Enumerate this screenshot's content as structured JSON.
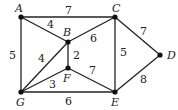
{
  "graph": {
    "nodes": [
      {
        "id": "A",
        "x": 21,
        "y": 17,
        "lx": 15,
        "ly": 12
      },
      {
        "id": "B",
        "x": 68,
        "y": 42,
        "lx": 63,
        "ly": 36
      },
      {
        "id": "C",
        "x": 115,
        "y": 17,
        "lx": 112,
        "ly": 12
      },
      {
        "id": "D",
        "x": 160,
        "y": 55,
        "lx": 167,
        "ly": 59
      },
      {
        "id": "E",
        "x": 115,
        "y": 92,
        "lx": 111,
        "ly": 106
      },
      {
        "id": "F",
        "x": 68,
        "y": 68,
        "lx": 63,
        "ly": 82
      },
      {
        "id": "G",
        "x": 21,
        "y": 92,
        "lx": 16,
        "ly": 106
      }
    ],
    "edges": [
      {
        "from": "A",
        "to": "C",
        "weight": "7",
        "lx": 65,
        "ly": 14
      },
      {
        "from": "A",
        "to": "B",
        "weight": "4",
        "lx": 47,
        "ly": 28
      },
      {
        "from": "A",
        "to": "G",
        "weight": "5",
        "lx": 9,
        "ly": 59
      },
      {
        "from": "B",
        "to": "C",
        "weight": "6",
        "lx": 90,
        "ly": 42
      },
      {
        "from": "B",
        "to": "F",
        "weight": "2",
        "lx": 73,
        "ly": 59
      },
      {
        "from": "B",
        "to": "G",
        "weight": "4",
        "lx": 38,
        "ly": 62
      },
      {
        "from": "C",
        "to": "E",
        "weight": "5",
        "lx": 120,
        "ly": 56
      },
      {
        "from": "C",
        "to": "D",
        "weight": "7",
        "lx": 140,
        "ly": 35
      },
      {
        "from": "D",
        "to": "E",
        "weight": "8",
        "lx": 140,
        "ly": 83
      },
      {
        "from": "F",
        "to": "G",
        "weight": "3",
        "lx": 49,
        "ly": 88
      },
      {
        "from": "F",
        "to": "E",
        "weight": "7",
        "lx": 89,
        "ly": 74
      },
      {
        "from": "G",
        "to": "E",
        "weight": "6",
        "lx": 65,
        "ly": 105
      }
    ]
  }
}
